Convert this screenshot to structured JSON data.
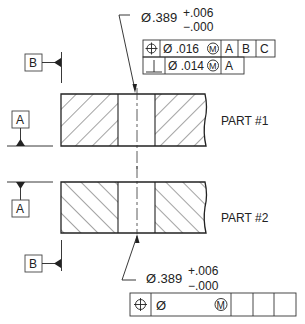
{
  "diagram": {
    "type": "GD&T technical drawing",
    "parts": [
      {
        "label": "PART  #1",
        "hatch": "forward"
      },
      {
        "label": "PART  #2",
        "hatch": "backward"
      }
    ],
    "top_dimension": {
      "diameter_symbol": "Ø",
      "nominal": ".389",
      "upper_tol": "+.006",
      "lower_tol": "−.000"
    },
    "top_feature_control_frame": {
      "row1": {
        "symbol": "⌖",
        "tolerance": "Ø .016",
        "modifier": "M",
        "datums": [
          "A",
          "B",
          "C"
        ]
      },
      "row2": {
        "symbol": "⊥",
        "tolerance": "Ø .014",
        "modifier": "M",
        "datums": [
          "A"
        ]
      }
    },
    "bottom_dimension": {
      "diameter_symbol": "Ø",
      "nominal": ".389",
      "upper_tol": "+.006",
      "lower_tol": "−.000"
    },
    "bottom_feature_control_frame": {
      "symbol": "⌖",
      "tolerance": "Ø",
      "modifier": "M",
      "datums": [
        "",
        "",
        ""
      ]
    },
    "datum_labels": {
      "b_top": "B",
      "a_part1": "A",
      "a_part2": "A",
      "b_bottom": "B"
    },
    "colors": {
      "line": "#222222",
      "background": "#ffffff"
    }
  }
}
